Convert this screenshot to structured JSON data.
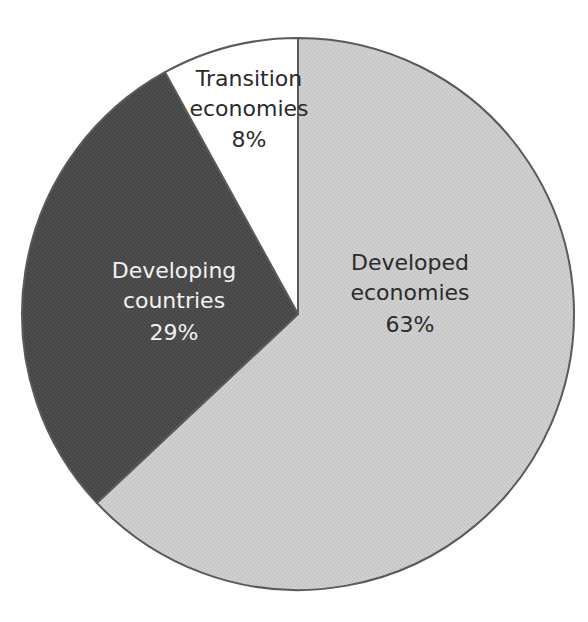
{
  "chart_data": {
    "type": "pie",
    "title": "",
    "subtitle": "",
    "xlabel": "",
    "ylabel": "",
    "legend_position": "none",
    "grid": false,
    "units": "percent",
    "start_angle_deg": 0,
    "direction": "clockwise",
    "categories": [
      "Developed economies",
      "Developing countries",
      "Transition economies"
    ],
    "values": [
      63,
      29,
      8
    ],
    "labels": [
      "63%",
      "29%",
      "8%"
    ],
    "colors": [
      "#c8c8c8",
      "#4a4a4a",
      "#ffffff"
    ],
    "slices": [
      {
        "name": "Developed economies",
        "value": 63,
        "value_label": "63%",
        "color": "#c8c8c8",
        "label_line_1": "Developed",
        "label_line_2": "economies",
        "label_line_3": "63%",
        "label_color": "#2b2b2b",
        "label_x": 410,
        "label_y": 264,
        "start_deg": 0,
        "end_deg": 226.8
      },
      {
        "name": "Developing countries",
        "value": 29,
        "value_label": "29%",
        "color": "#4a4a4a",
        "label_line_1": "Developing",
        "label_line_2": "countries",
        "label_line_3": "29%",
        "label_color": "#f2f2f2",
        "label_x": 174,
        "label_y": 272,
        "start_deg": 226.8,
        "end_deg": 331.2
      },
      {
        "name": "Transition economies",
        "value": 8,
        "value_label": "8%",
        "color": "#ffffff",
        "label_line_1": "Transition",
        "label_line_2": "economies",
        "label_line_3": "8%",
        "label_color": "#2b2b2b",
        "label_x": 249,
        "label_y": 80,
        "start_deg": 331.2,
        "end_deg": 360
      }
    ],
    "geometry": {
      "center_x": 298,
      "center_y": 314,
      "radius": 276,
      "outline_color": "#5a5a5a",
      "outline_width": 2,
      "background": "#ffffff"
    }
  }
}
